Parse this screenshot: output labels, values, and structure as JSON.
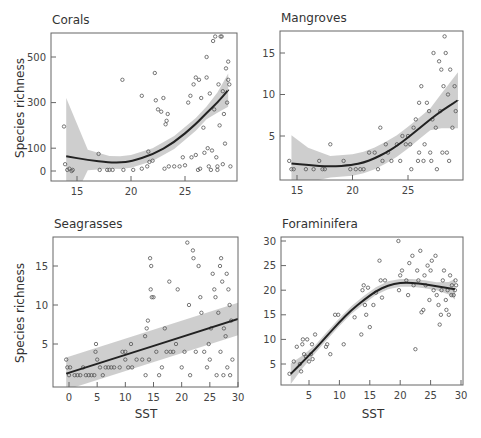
{
  "figure": {
    "y_axis_label": "Species richness",
    "x_axis_label": "SST"
  },
  "chart_data": [
    {
      "type": "scatter",
      "title": "Corals",
      "xlabel": "",
      "ylabel": "Species richness",
      "xticks": [
        15,
        20,
        25
      ],
      "yticks": [
        0,
        100,
        300,
        500
      ],
      "xlim": [
        13.5,
        29.5
      ],
      "ylim": [
        -40,
        610
      ],
      "fit": "quadratic smooth with 95% CI band",
      "fit_curve": {
        "x": [
          14,
          16,
          18,
          19,
          20,
          22,
          24,
          26,
          27,
          28,
          29
        ],
        "y": [
          65,
          48,
          38,
          37,
          42,
          72,
          125,
          205,
          255,
          300,
          355
        ]
      },
      "points": [
        [
          13.8,
          195
        ],
        [
          13.9,
          30
        ],
        [
          14.1,
          5
        ],
        [
          14.3,
          10
        ],
        [
          14.5,
          0
        ],
        [
          14.6,
          5
        ],
        [
          17,
          75
        ],
        [
          17.1,
          5
        ],
        [
          17.8,
          5
        ],
        [
          18,
          5
        ],
        [
          18.3,
          5
        ],
        [
          19.2,
          400
        ],
        [
          19.3,
          5
        ],
        [
          20.2,
          5
        ],
        [
          21,
          10
        ],
        [
          21,
          330
        ],
        [
          21.5,
          20
        ],
        [
          21.6,
          85
        ],
        [
          21.7,
          40
        ],
        [
          22,
          45
        ],
        [
          22.2,
          430
        ],
        [
          22.3,
          310
        ],
        [
          22.5,
          270
        ],
        [
          22.8,
          260
        ],
        [
          23,
          320
        ],
        [
          23.1,
          10
        ],
        [
          23.2,
          205
        ],
        [
          23.3,
          220
        ],
        [
          23.4,
          250
        ],
        [
          23.5,
          20
        ],
        [
          24,
          20
        ],
        [
          24.5,
          20
        ],
        [
          24.8,
          60
        ],
        [
          25,
          25
        ],
        [
          25.3,
          300
        ],
        [
          25.5,
          330
        ],
        [
          25.6,
          60
        ],
        [
          25.8,
          380
        ],
        [
          26,
          410
        ],
        [
          26,
          70
        ],
        [
          26.2,
          5
        ],
        [
          26.3,
          400
        ],
        [
          26.5,
          320
        ],
        [
          26.8,
          80
        ],
        [
          27,
          410
        ],
        [
          27.1,
          100
        ],
        [
          27.2,
          20
        ],
        [
          27.3,
          340
        ],
        [
          27.5,
          90
        ],
        [
          27.6,
          570
        ],
        [
          27.8,
          590
        ],
        [
          27.9,
          60
        ],
        [
          28,
          20
        ],
        [
          28.1,
          380
        ],
        [
          28.2,
          200
        ],
        [
          28.3,
          590
        ],
        [
          28.4,
          590
        ],
        [
          28.5,
          350
        ],
        [
          28.6,
          250
        ],
        [
          28.7,
          120
        ],
        [
          28.8,
          450
        ],
        [
          29,
          480
        ],
        [
          29.1,
          380
        ],
        [
          29.2,
          20
        ],
        [
          26.4,
          10
        ],
        [
          27.4,
          5
        ],
        [
          28,
          5
        ],
        [
          28.5,
          30
        ],
        [
          27,
          500
        ],
        [
          26.7,
          190
        ],
        [
          27.7,
          270
        ],
        [
          28.9,
          300
        ],
        [
          29,
          400
        ]
      ]
    },
    {
      "type": "scatter",
      "title": "Mangroves",
      "xlabel": "",
      "ylabel": "",
      "xticks": [
        15,
        20,
        25
      ],
      "yticks": [
        5,
        10,
        15
      ],
      "xlim": [
        14,
        29.5
      ],
      "ylim": [
        0,
        17.5
      ],
      "fit": "quadratic smooth with 95% CI band",
      "fit_curve": {
        "x": [
          14.5,
          16,
          18,
          20,
          21,
          22,
          23,
          24,
          25,
          26,
          27,
          28,
          29.5
        ],
        "y": [
          1.7,
          1.5,
          1.3,
          1.5,
          1.8,
          2.3,
          3.0,
          3.8,
          4.8,
          5.9,
          7.0,
          8.0,
          9.3
        ]
      },
      "points": [
        [
          14.3,
          2
        ],
        [
          14.5,
          1
        ],
        [
          14.7,
          1
        ],
        [
          15.8,
          1
        ],
        [
          16.5,
          1
        ],
        [
          17,
          2
        ],
        [
          17.3,
          1
        ],
        [
          17.5,
          1
        ],
        [
          18,
          4
        ],
        [
          19.2,
          2
        ],
        [
          19.8,
          1
        ],
        [
          20.3,
          1
        ],
        [
          20.7,
          1
        ],
        [
          21,
          1
        ],
        [
          21.5,
          3
        ],
        [
          22,
          3
        ],
        [
          22.3,
          1
        ],
        [
          22.5,
          6
        ],
        [
          22.7,
          2
        ],
        [
          23,
          4
        ],
        [
          23.2,
          3
        ],
        [
          23.5,
          2
        ],
        [
          24,
          4
        ],
        [
          24.3,
          2
        ],
        [
          24.5,
          5
        ],
        [
          24.8,
          4
        ],
        [
          25,
          5
        ],
        [
          25.2,
          4
        ],
        [
          25.5,
          6
        ],
        [
          25.7,
          7
        ],
        [
          26,
          9
        ],
        [
          26,
          3
        ],
        [
          26.2,
          11
        ],
        [
          26.5,
          4
        ],
        [
          26.7,
          9
        ],
        [
          26.9,
          8
        ],
        [
          27,
          3
        ],
        [
          27.2,
          7
        ],
        [
          27.3,
          15
        ],
        [
          27.5,
          6
        ],
        [
          27.6,
          1
        ],
        [
          27.8,
          14
        ],
        [
          28,
          13
        ],
        [
          28.2,
          11
        ],
        [
          28.3,
          17
        ],
        [
          28.4,
          15
        ],
        [
          28.5,
          3
        ],
        [
          28.6,
          10
        ],
        [
          28.8,
          13
        ],
        [
          29,
          6
        ],
        [
          29.2,
          11
        ],
        [
          29.3,
          8
        ],
        [
          28.7,
          2
        ],
        [
          27.9,
          8
        ],
        [
          26.4,
          2
        ],
        [
          25.9,
          2
        ],
        [
          25.3,
          1
        ],
        [
          27.1,
          2
        ],
        [
          28.1,
          3
        ]
      ]
    },
    {
      "type": "scatter",
      "title": "Seagrasses",
      "xlabel": "SST",
      "ylabel": "Species richness",
      "xticks": [
        0,
        5,
        10,
        15,
        20,
        25,
        30
      ],
      "yticks": [
        5,
        10,
        15
      ],
      "xlim": [
        -3,
        30
      ],
      "ylim": [
        0,
        18.5
      ],
      "fit": "linear with 95% CI band",
      "fit_curve": {
        "x": [
          -0.5,
          30
        ],
        "y": [
          1.2,
          8.2
        ]
      },
      "points": [
        [
          -0.5,
          3
        ],
        [
          -0.3,
          2
        ],
        [
          0,
          1
        ],
        [
          0.2,
          2
        ],
        [
          1,
          1
        ],
        [
          1.5,
          1
        ],
        [
          2,
          1
        ],
        [
          2.5,
          2
        ],
        [
          3,
          1
        ],
        [
          3.5,
          1
        ],
        [
          4,
          1
        ],
        [
          4.5,
          1
        ],
        [
          4.7,
          4
        ],
        [
          4.8,
          5
        ],
        [
          5,
          3
        ],
        [
          5.5,
          2
        ],
        [
          6,
          1
        ],
        [
          6.5,
          2
        ],
        [
          7,
          2
        ],
        [
          7.5,
          2
        ],
        [
          8,
          2
        ],
        [
          9,
          2
        ],
        [
          9.5,
          4
        ],
        [
          10,
          3
        ],
        [
          10,
          4
        ],
        [
          10.5,
          2
        ],
        [
          11,
          5
        ],
        [
          11.2,
          2
        ],
        [
          12,
          3
        ],
        [
          13,
          3
        ],
        [
          13.5,
          6
        ],
        [
          13.6,
          1
        ],
        [
          13.8,
          7
        ],
        [
          14,
          8
        ],
        [
          14.2,
          3
        ],
        [
          14.4,
          16
        ],
        [
          14.5,
          12
        ],
        [
          14.6,
          15
        ],
        [
          14.7,
          11
        ],
        [
          15,
          11
        ],
        [
          15.5,
          4
        ],
        [
          16,
          1
        ],
        [
          16.5,
          2
        ],
        [
          17,
          7
        ],
        [
          17.3,
          4
        ],
        [
          17.8,
          13
        ],
        [
          18,
          4
        ],
        [
          18.5,
          4
        ],
        [
          19,
          5
        ],
        [
          19.3,
          12
        ],
        [
          20,
          2
        ],
        [
          20.5,
          4
        ],
        [
          21,
          18
        ],
        [
          21.3,
          10
        ],
        [
          21.5,
          1
        ],
        [
          22,
          17
        ],
        [
          22.1,
          16
        ],
        [
          22.5,
          4
        ],
        [
          23,
          15
        ],
        [
          23.3,
          11
        ],
        [
          23.5,
          9
        ],
        [
          24,
          4
        ],
        [
          24.5,
          2
        ],
        [
          25,
          3
        ],
        [
          25.5,
          14
        ],
        [
          25.8,
          12
        ],
        [
          26,
          11
        ],
        [
          26.5,
          9
        ],
        [
          26.8,
          15
        ],
        [
          27,
          16
        ],
        [
          27.2,
          13
        ],
        [
          27.5,
          7
        ],
        [
          27.8,
          6
        ],
        [
          28,
          14
        ],
        [
          28.3,
          12
        ],
        [
          28.5,
          10
        ],
        [
          28.8,
          8
        ],
        [
          29,
          3
        ],
        [
          26.2,
          1
        ],
        [
          27.4,
          1
        ],
        [
          28.6,
          1
        ],
        [
          25.2,
          7
        ],
        [
          24.8,
          5
        ],
        [
          26.9,
          4
        ],
        [
          28.1,
          2
        ]
      ]
    },
    {
      "type": "scatter",
      "title": "Foraminifera",
      "xlabel": "SST",
      "ylabel": "",
      "xticks": [
        5,
        10,
        15,
        20,
        25,
        30
      ],
      "yticks": [
        5,
        10,
        15,
        20,
        25,
        30
      ],
      "xlim": [
        0,
        30.5
      ],
      "ylim": [
        0,
        31
      ],
      "fit": "smooth with 95% CI band",
      "fit_curve": {
        "x": [
          2,
          4,
          6,
          8,
          10,
          12,
          14,
          16,
          18,
          20,
          22,
          24,
          26,
          28,
          29
        ],
        "y": [
          3,
          5.5,
          8,
          10.8,
          13.5,
          16,
          18,
          19.8,
          21,
          21.5,
          21.5,
          21.2,
          20.8,
          20.4,
          20.2
        ]
      },
      "points": [
        [
          1.8,
          3
        ],
        [
          2.5,
          5.5
        ],
        [
          3,
          8.5
        ],
        [
          3.5,
          5
        ],
        [
          3.7,
          3.5
        ],
        [
          3.9,
          9
        ],
        [
          4,
          10
        ],
        [
          4.2,
          7
        ],
        [
          4.5,
          6.5
        ],
        [
          4.7,
          10
        ],
        [
          5,
          5.5
        ],
        [
          5.3,
          7
        ],
        [
          5.5,
          9
        ],
        [
          5.6,
          6
        ],
        [
          6,
          11
        ],
        [
          7.8,
          8.5
        ],
        [
          8,
          9
        ],
        [
          8.5,
          7
        ],
        [
          9.3,
          15
        ],
        [
          9.8,
          15
        ],
        [
          10.7,
          9
        ],
        [
          12.5,
          14.5
        ],
        [
          13.6,
          11
        ],
        [
          13.8,
          20
        ],
        [
          14,
          21
        ],
        [
          14.2,
          17
        ],
        [
          14.4,
          15
        ],
        [
          14.7,
          20.5
        ],
        [
          15,
          12.5
        ],
        [
          15.6,
          17
        ],
        [
          16,
          19.5
        ],
        [
          16.6,
          26
        ],
        [
          16.8,
          22
        ],
        [
          17,
          18.5
        ],
        [
          17.5,
          22
        ],
        [
          19.7,
          30
        ],
        [
          19.8,
          20
        ],
        [
          20,
          23
        ],
        [
          20.3,
          24
        ],
        [
          21,
          22
        ],
        [
          21.3,
          19
        ],
        [
          21.5,
          25.5
        ],
        [
          22,
          27
        ],
        [
          22.2,
          21
        ],
        [
          22.5,
          8
        ],
        [
          22.8,
          24
        ],
        [
          23,
          22
        ],
        [
          23.3,
          28
        ],
        [
          23.5,
          15.5
        ],
        [
          23.8,
          16
        ],
        [
          24,
          23
        ],
        [
          24.2,
          21
        ],
        [
          24.5,
          25
        ],
        [
          24.8,
          18
        ],
        [
          25,
          24
        ],
        [
          25.2,
          26
        ],
        [
          25.5,
          20
        ],
        [
          25.8,
          27
        ],
        [
          26,
          19
        ],
        [
          26.3,
          17
        ],
        [
          26.5,
          13
        ],
        [
          26.7,
          15
        ],
        [
          27,
          22
        ],
        [
          27.2,
          24
        ],
        [
          27.5,
          18
        ],
        [
          27.8,
          20
        ],
        [
          28,
          15
        ],
        [
          28.2,
          23
        ],
        [
          28.5,
          21
        ],
        [
          28.8,
          19
        ],
        [
          29,
          20
        ],
        [
          29.2,
          21
        ],
        [
          26.8,
          20
        ],
        [
          27.6,
          16
        ],
        [
          28.4,
          19
        ],
        [
          29.1,
          22
        ]
      ]
    }
  ]
}
